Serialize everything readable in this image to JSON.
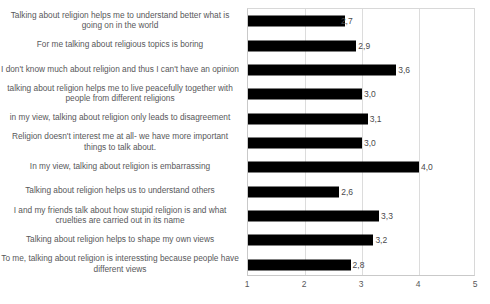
{
  "chart_data": {
    "type": "bar",
    "orientation": "horizontal",
    "title": "",
    "xlabel": "",
    "ylabel": "",
    "xlim": [
      1,
      5
    ],
    "xticks": [
      "1",
      "2",
      "3",
      "4",
      "5"
    ],
    "grid": true,
    "legend": "none",
    "decimal_separator": ",",
    "bar_color": "#000000",
    "grid_color": "#dcdcdc",
    "label_color": "#58585a",
    "categories": [
      "Talking about religion helps me to understand better what is going on in the world",
      "For me talking about religious topics is boring",
      "I don't know much about religion and thus I can't have an opinion",
      "talking about religion helps me to live peacefully together with people from different religions",
      "in my view, talking about religion only leads to disagreement",
      "Religion doesn't interest me at all- we have more important things to talk about.",
      "In my view, talking about religion is embarrassing",
      "Talking about religion helps us to understand others",
      "I and my friends talk about how stupid religion is and what cruelties are carried out in its name",
      "Talking about religion helps to shape my own views",
      "To me, talking about religion is interessting because people have different views"
    ],
    "values": [
      2.7,
      2.9,
      3.6,
      3.0,
      3.1,
      3.0,
      4.0,
      2.6,
      3.3,
      3.2,
      2.8
    ],
    "value_labels": [
      "2,7",
      "2,9",
      "3,6",
      "3,0",
      "3,1",
      "3,0",
      "4,0",
      "2,6",
      "3,3",
      "3,2",
      "2,8"
    ]
  }
}
